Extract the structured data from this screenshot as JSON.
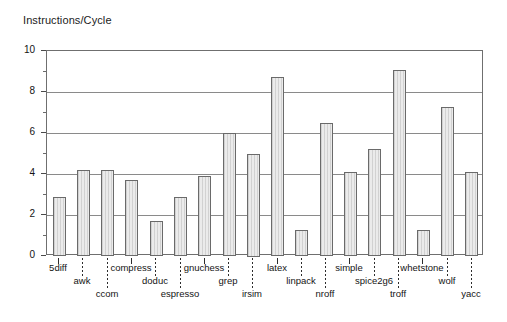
{
  "chart_data": {
    "type": "bar",
    "title": "Instructions/Cycle",
    "xlabel": "",
    "ylabel": "",
    "ylim": [
      0,
      10
    ],
    "yticks": [
      0,
      2,
      4,
      6,
      8,
      10
    ],
    "ytick_labels": [
      "0",
      "2",
      "4",
      "6",
      "8",
      "10"
    ],
    "yminor_ticks": [
      1,
      3,
      5,
      7,
      9
    ],
    "grid": true,
    "grid_axis": "y",
    "legend": false,
    "bar_fill_color": "#ebebeb",
    "bar_edge_color": "#6a6a6a",
    "categories": [
      "5diff",
      "awk",
      "ccom",
      "compress",
      "doduc",
      "espresso",
      "gnuchess",
      "grep",
      "irsim",
      "latex",
      "linpack",
      "nroff",
      "simple",
      "spice2g6",
      "troff",
      "whetstone",
      "wolf",
      "yacc"
    ],
    "values": [
      2.9,
      4.2,
      4.2,
      3.7,
      1.7,
      2.9,
      3.9,
      6.0,
      5.0,
      8.75,
      1.25,
      6.5,
      4.1,
      5.2,
      9.05,
      1.25,
      7.25,
      4.1
    ]
  },
  "axis": {
    "y_tick_labels": [
      "10",
      "8",
      "6",
      "4",
      "2",
      "0"
    ],
    "title": "Instructions/Cycle"
  }
}
